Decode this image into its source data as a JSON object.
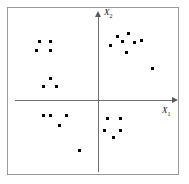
{
  "figure": {
    "title": "",
    "background_color": "#ffffff",
    "frame_color": "#9a9a9a",
    "axis_color": "#6e6e6e",
    "point_color": "#000000"
  },
  "axes": {
    "x_label_text": "X",
    "x_label_sub": "1",
    "y_label_text": "X",
    "y_label_sub": "2"
  },
  "chart_data": {
    "type": "scatter",
    "title": "",
    "xlabel": "X1",
    "ylabel": "X2",
    "xlim": [
      -1,
      1
    ],
    "ylim": [
      -1,
      1
    ],
    "grid": false,
    "legend": null,
    "axis_origin_px": {
      "x": 98,
      "y": 100
    },
    "marker": {
      "shape": "square",
      "size_px": 3,
      "color": "#000000"
    },
    "series": [
      {
        "name": "cluster-upper-left-a",
        "quadrant": "II",
        "points_px": [
          {
            "x": 39,
            "y": 41
          },
          {
            "x": 50,
            "y": 41
          },
          {
            "x": 36,
            "y": 50
          },
          {
            "x": 50,
            "y": 50
          }
        ]
      },
      {
        "name": "cluster-upper-left-b",
        "quadrant": "II",
        "points_px": [
          {
            "x": 50,
            "y": 78
          },
          {
            "x": 43,
            "y": 86
          },
          {
            "x": 56,
            "y": 86
          }
        ]
      },
      {
        "name": "cluster-upper-right",
        "quadrant": "I",
        "points_px": [
          {
            "x": 117,
            "y": 36
          },
          {
            "x": 128,
            "y": 33
          },
          {
            "x": 110,
            "y": 45
          },
          {
            "x": 122,
            "y": 41
          },
          {
            "x": 134,
            "y": 42
          },
          {
            "x": 141,
            "y": 40
          },
          {
            "x": 126,
            "y": 52
          }
        ]
      },
      {
        "name": "point-right-outlier",
        "quadrant": "I",
        "points_px": [
          {
            "x": 152,
            "y": 68
          }
        ]
      },
      {
        "name": "cluster-lower-left",
        "quadrant": "III",
        "points_px": [
          {
            "x": 43,
            "y": 115
          },
          {
            "x": 50,
            "y": 115
          },
          {
            "x": 66,
            "y": 115
          },
          {
            "x": 59,
            "y": 125
          }
        ]
      },
      {
        "name": "point-lower-left-outlier",
        "quadrant": "III",
        "points_px": [
          {
            "x": 79,
            "y": 150
          }
        ]
      },
      {
        "name": "cluster-lower-right",
        "quadrant": "IV",
        "points_px": [
          {
            "x": 107,
            "y": 118
          },
          {
            "x": 120,
            "y": 118
          },
          {
            "x": 104,
            "y": 130
          },
          {
            "x": 120,
            "y": 130
          },
          {
            "x": 113,
            "y": 137
          }
        ]
      }
    ]
  }
}
